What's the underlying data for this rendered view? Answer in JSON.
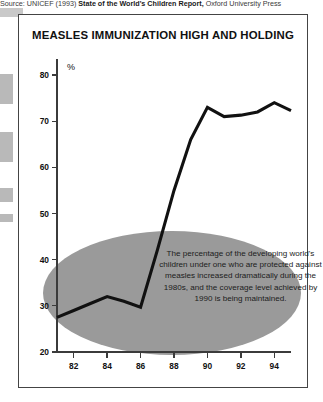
{
  "source": {
    "lead": "Source: UNICEF (1993) ",
    "title": "State of the World's Children Report,",
    "tail": " Oxford University Press"
  },
  "figure": {
    "title": "MEASLES IMMUNIZATION HIGH AND HOLDING",
    "annotation": "The percentage of the developing world's children under one who are protected against measles increased dramatically  during the 1980s, and the coverage level achieved by 1990 is being maintained.",
    "colors": {
      "line": "#111111",
      "ellipse": "#9a9a9a",
      "axis": "#3b3b3b",
      "frame": "#444444",
      "background": "#ffffff"
    }
  },
  "chart_data": {
    "type": "line",
    "title": "MEASLES IMMUNIZATION HIGH AND HOLDING",
    "xlabel": "",
    "ylabel": "%",
    "ylim": [
      20,
      80
    ],
    "xlim": [
      1981,
      1995
    ],
    "yticks": [
      20,
      30,
      40,
      50,
      60,
      70,
      80
    ],
    "xticks": [
      1982,
      1984,
      1986,
      1988,
      1990,
      1992,
      1994
    ],
    "xticklabels": [
      "82",
      "84",
      "86",
      "88",
      "90",
      "92",
      "94"
    ],
    "grid": false,
    "legend": false,
    "series": [
      {
        "name": "Measles immunization coverage",
        "x": [
          1981,
          1982,
          1983,
          1984,
          1985,
          1986,
          1987,
          1988,
          1989,
          1990,
          1991,
          1992,
          1993,
          1994,
          1995
        ],
        "values": [
          27.5,
          29.0,
          30.5,
          32.0,
          31.0,
          29.7,
          42.0,
          55.0,
          66.0,
          73.0,
          71.0,
          71.3,
          72.0,
          74.0,
          72.3
        ]
      }
    ],
    "annotation": "The percentage of the developing world's children under one who are protected against measles increased dramatically  during the 1980s, and the coverage level achieved by 1990 is being maintained."
  }
}
